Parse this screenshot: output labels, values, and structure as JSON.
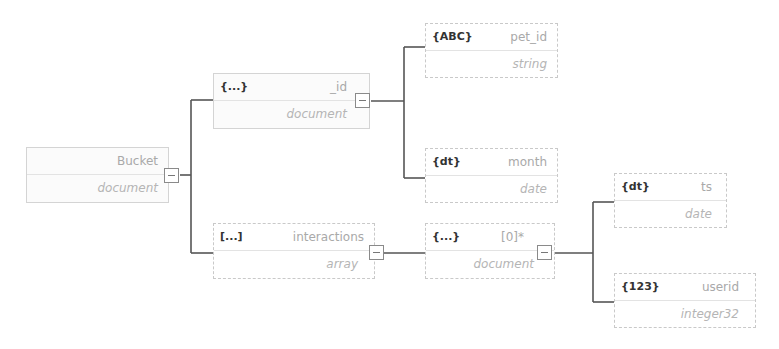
{
  "diagram": {
    "root": {
      "name": "Bucket",
      "type": "document",
      "badge": "",
      "collapse_label": "−"
    },
    "nodes": {
      "id": {
        "badge": "{...}",
        "name": "_id",
        "type": "document"
      },
      "pet_id": {
        "badge": "{ABC}",
        "name": "pet_id",
        "type": "string"
      },
      "month": {
        "badge": "{dt}",
        "name": "month",
        "type": "date"
      },
      "interactions": {
        "badge": "[...]",
        "name": "interactions",
        "type": "array"
      },
      "item0": {
        "badge": "{...}",
        "name": "[0]*",
        "type": "document"
      },
      "ts": {
        "badge": "{dt}",
        "name": "ts",
        "type": "date"
      },
      "userid": {
        "badge": "{123}",
        "name": "userid",
        "type": "integer32"
      }
    },
    "colors": {
      "line": "#4a4a4a",
      "border": "#c9c9c9",
      "name_text": "#a9a9a9",
      "badge_text": "#333333"
    }
  }
}
